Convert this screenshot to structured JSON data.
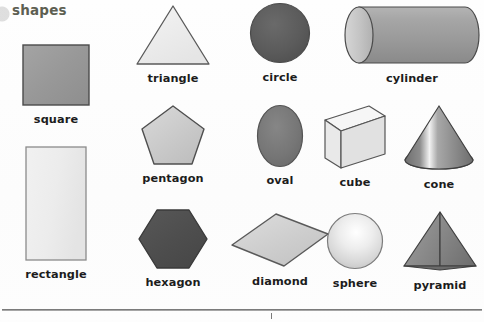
{
  "page": {
    "heading": "shapes",
    "heading_color": "#5d5f52",
    "background_color": "#fdfdfd",
    "width": 484,
    "height": 322
  },
  "shapes": [
    {
      "id": "square",
      "label": "square",
      "icon": "square-icon",
      "fill": "#989898",
      "stroke": "#4a4a4a",
      "kind": "2d"
    },
    {
      "id": "rectangle",
      "label": "rectangle",
      "icon": "rectangle-icon",
      "fill": "#ececec",
      "stroke": "#8b8b8b",
      "kind": "2d"
    },
    {
      "id": "triangle",
      "label": "triangle",
      "icon": "triangle-icon",
      "fill": "#ededed",
      "stroke": "#5a5a5a",
      "kind": "2d"
    },
    {
      "id": "pentagon",
      "label": "pentagon",
      "icon": "pentagon-icon",
      "fill": "#c9c9c9",
      "stroke": "#4f4f4f",
      "kind": "2d"
    },
    {
      "id": "hexagon",
      "label": "hexagon",
      "icon": "hexagon-icon",
      "fill": "#4f4f4f",
      "stroke": "#3a3a3a",
      "kind": "2d"
    },
    {
      "id": "circle",
      "label": "circle",
      "icon": "circle-icon",
      "fill": "#5b5b5b",
      "stroke": "#4a4a4a",
      "kind": "2d"
    },
    {
      "id": "oval",
      "label": "oval",
      "icon": "oval-icon",
      "fill": "#767676",
      "stroke": "#545454",
      "kind": "2d"
    },
    {
      "id": "diamond",
      "label": "diamond",
      "icon": "diamond-icon",
      "fill": "#cfcfcf",
      "stroke": "#5a5a5a",
      "kind": "2d"
    },
    {
      "id": "cylinder",
      "label": "cylinder",
      "icon": "cylinder-icon",
      "fill": "#9d9d9d",
      "stroke": "#4a4a4a",
      "kind": "3d"
    },
    {
      "id": "cube",
      "label": "cube",
      "icon": "cube-icon",
      "fill": "#e6e6e6",
      "stroke": "#555555",
      "kind": "3d"
    },
    {
      "id": "cone",
      "label": "cone",
      "icon": "cone-icon",
      "fill": "#8a8a8a",
      "stroke": "#3f3f3f",
      "kind": "3d"
    },
    {
      "id": "sphere",
      "label": "sphere",
      "icon": "sphere-icon",
      "fill": "#dcdcdc",
      "stroke": "#7c7c7c",
      "kind": "3d"
    },
    {
      "id": "pyramid",
      "label": "pyramid",
      "icon": "pyramid-icon",
      "fill": "#8d8d8d",
      "stroke": "#3f3f3f",
      "kind": "3d"
    }
  ],
  "footer": {
    "rule": "horizontal-rule",
    "tick": "center-tick-mark"
  }
}
